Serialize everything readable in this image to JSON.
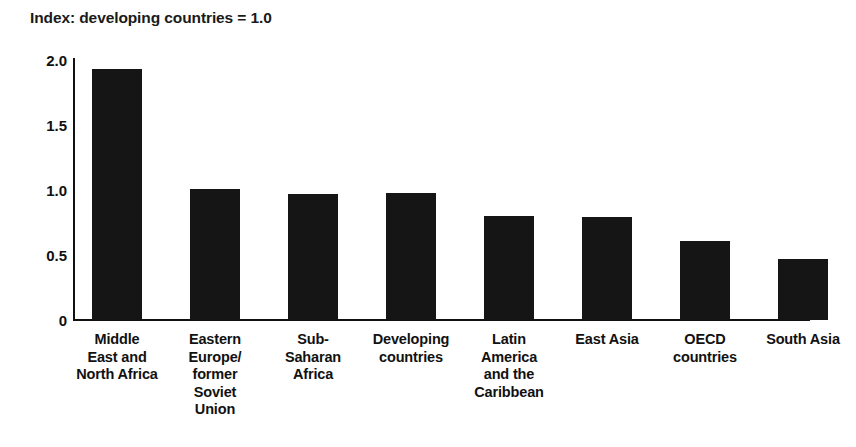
{
  "chart_data": {
    "type": "bar",
    "title": "Index: developing countries = 1.0",
    "xlabel": "",
    "ylabel": "",
    "ylim": [
      0,
      2.0
    ],
    "yticks": [
      "0",
      "0.5",
      "1.0",
      "1.5",
      "2.0"
    ],
    "ytick_values": [
      0,
      0.5,
      1.0,
      1.5,
      2.0
    ],
    "grid": false,
    "legend": "none",
    "bar_color": "#151515",
    "axis_color": "#111111",
    "categories": [
      "Middle East and North Africa",
      "Eastern Europe/ former Soviet Union",
      "Sub-Saharan Africa",
      "Developing countries",
      "Latin America and the Caribbean",
      "East Asia",
      "OECD countries",
      "South Asia"
    ],
    "values": [
      1.93,
      1.01,
      0.97,
      0.98,
      0.8,
      0.79,
      0.61,
      0.47
    ],
    "bars": [
      {
        "label_lines": [
          "Middle",
          "East and",
          "North Africa"
        ],
        "value": 1.93
      },
      {
        "label_lines": [
          "Eastern",
          "Europe/",
          "former",
          "Soviet",
          "Union"
        ],
        "value": 1.01
      },
      {
        "label_lines": [
          "Sub-",
          "Saharan",
          "Africa"
        ],
        "value": 0.97
      },
      {
        "label_lines": [
          "Developing",
          "countries"
        ],
        "value": 0.98
      },
      {
        "label_lines": [
          "Latin",
          "America",
          "and the",
          "Caribbean"
        ],
        "value": 0.8
      },
      {
        "label_lines": [
          "East Asia"
        ],
        "value": 0.79
      },
      {
        "label_lines": [
          "OECD",
          "countries"
        ],
        "value": 0.61
      },
      {
        "label_lines": [
          "South Asia"
        ],
        "value": 0.47
      }
    ]
  }
}
